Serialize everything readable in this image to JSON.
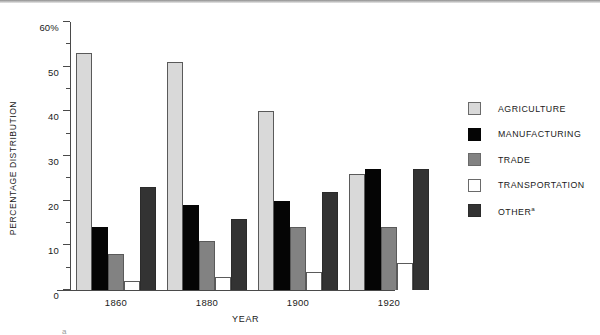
{
  "chart_data": {
    "type": "bar",
    "title": "",
    "xlabel": "YEAR",
    "ylabel": "PERCENTAGE DISTRIBUTION",
    "ylim": [
      0,
      60
    ],
    "ytick_labels": [
      "0",
      "10",
      "20",
      "30",
      "40",
      "50",
      "60%"
    ],
    "ytick_values": [
      0,
      10,
      20,
      30,
      40,
      50,
      60
    ],
    "yminor_values": [
      5,
      15,
      25,
      35,
      45,
      55
    ],
    "grid": false,
    "legend_position": "right",
    "categories": [
      "1860",
      "1880",
      "1900",
      "1920"
    ],
    "series": [
      {
        "name": "AGRICULTURE",
        "color": "#d9d9d9",
        "values": [
          53,
          51,
          40,
          26
        ]
      },
      {
        "name": "MANUFACTURING",
        "color": "#050505",
        "values": [
          14,
          19,
          20,
          27
        ]
      },
      {
        "name": "TRADE",
        "color": "#828282",
        "values": [
          8,
          11,
          14,
          14
        ]
      },
      {
        "name": "TRANSPORTATION",
        "color": "#ffffff",
        "values": [
          2,
          3,
          4,
          6
        ]
      },
      {
        "name": "OTHER",
        "color": "#333333",
        "values": [
          23,
          16,
          22,
          27
        ],
        "footnote_marker": "a"
      }
    ],
    "annotations": {
      "footnote_marker": "a"
    }
  },
  "legend": {
    "items": [
      {
        "label": "AGRICULTURE",
        "sup": ""
      },
      {
        "label": "MANUFACTURING",
        "sup": ""
      },
      {
        "label": "TRADE",
        "sup": ""
      },
      {
        "label": "TRANSPORTATION",
        "sup": ""
      },
      {
        "label": "OTHER",
        "sup": "a"
      }
    ]
  }
}
